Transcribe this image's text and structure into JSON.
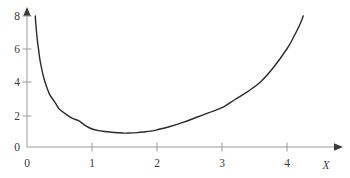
{
  "figure": {
    "background_color": "#ffffff",
    "curve_color": "#2b2b2b",
    "axis_color": "#9a9a9a",
    "text_color": "#3a3a3a"
  },
  "chart_data": {
    "type": "line",
    "title": "",
    "xlabel": "X",
    "ylabel": "",
    "grid": false,
    "legend": null,
    "xlim": [
      -0.05,
      4.45
    ],
    "ylim": [
      0,
      8.35
    ],
    "xticks": [
      0,
      1,
      2,
      3,
      4
    ],
    "xtick_labels": [
      "0",
      "1",
      "2",
      "3",
      "4"
    ],
    "yticks": [
      0,
      2,
      4,
      6,
      8
    ],
    "ytick_labels": [
      "0",
      "2",
      "4",
      "6",
      "8"
    ],
    "origin_label_x": "0",
    "origin_label_y": "0",
    "axis_arrows": [
      "x-right",
      "y-top"
    ],
    "series": [
      {
        "name": "curve",
        "description": "convex curve, vertical asymptote at x=0, minimum near x=1.5",
        "x": [
          0.127,
          0.14,
          0.16,
          0.18,
          0.2,
          0.23,
          0.26,
          0.3,
          0.35,
          0.4,
          0.45,
          0.5,
          0.6,
          0.7,
          0.8,
          0.9,
          1.0,
          1.1,
          1.2,
          1.3,
          1.4,
          1.5,
          1.6,
          1.7,
          1.8,
          1.9,
          2.0,
          2.2,
          2.4,
          2.6,
          2.8,
          3.0,
          3.2,
          3.4,
          3.6,
          3.8,
          4.0,
          4.1,
          4.2,
          4.25
        ],
        "y": [
          8.0,
          7.3,
          6.5,
          5.9,
          5.3,
          4.7,
          4.2,
          3.7,
          3.2,
          2.9,
          2.6,
          2.3,
          2.0,
          1.75,
          1.6,
          1.3,
          1.1,
          1.0,
          0.95,
          0.9,
          0.87,
          0.85,
          0.86,
          0.88,
          0.92,
          0.97,
          1.05,
          1.25,
          1.5,
          1.8,
          2.1,
          2.4,
          2.9,
          3.4,
          4.0,
          4.9,
          6.0,
          6.7,
          7.5,
          8.0
        ]
      }
    ]
  }
}
